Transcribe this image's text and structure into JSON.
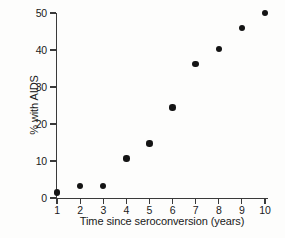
{
  "chart_data": {
    "type": "scatter",
    "title": "",
    "xlabel": "Time since seroconversion (years)",
    "ylabel": "% with AIDS",
    "x": [
      1,
      2,
      3,
      4,
      5,
      6,
      7,
      8,
      9,
      10
    ],
    "values": [
      1.5,
      3.2,
      3.2,
      10.7,
      14.7,
      24.5,
      36.2,
      40.3,
      46.0,
      50.0
    ],
    "series": [
      {
        "name": "% with AIDS",
        "values": [
          1.5,
          3.2,
          3.2,
          10.7,
          14.7,
          24.5,
          36.2,
          40.3,
          46.0,
          50.0
        ]
      }
    ],
    "xlim": [
      1,
      10
    ],
    "ylim": [
      0,
      50
    ],
    "xticks": [
      "1",
      "2",
      "3",
      "4",
      "5",
      "6",
      "7",
      "8",
      "9",
      "10"
    ],
    "yticks": [
      "0",
      "10",
      "20",
      "30",
      "40",
      "50"
    ],
    "grid": false,
    "legend": false,
    "marker": "filled-circle",
    "marker_color": "#141414",
    "axis_color": "#3a3a3a",
    "background_color": "#fdfdfc"
  }
}
